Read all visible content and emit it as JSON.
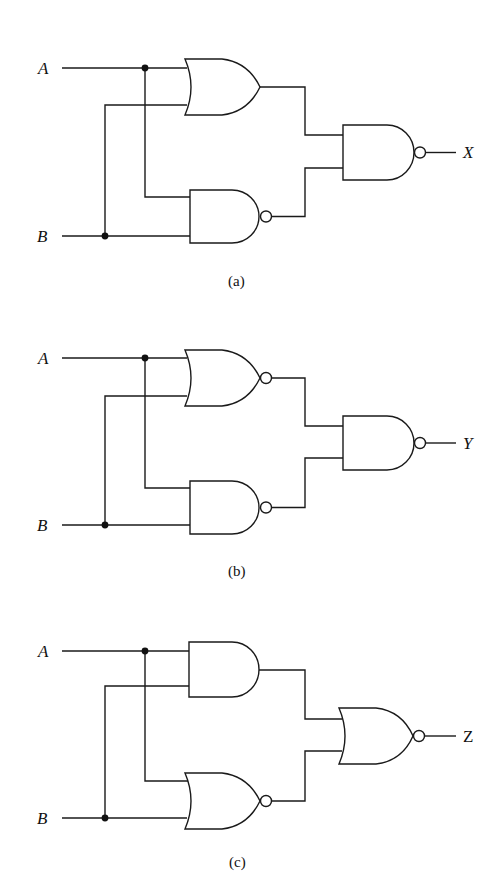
{
  "figure": {
    "panels": [
      {
        "id": "a",
        "caption": "(a)",
        "inputs": [
          "A",
          "B"
        ],
        "output": "X",
        "gates": [
          {
            "name": "upper",
            "type": "OR",
            "inputs": [
              "A",
              "B"
            ]
          },
          {
            "name": "lower",
            "type": "NAND",
            "inputs": [
              "A",
              "B"
            ]
          },
          {
            "name": "output",
            "type": "NAND",
            "inputs": [
              "upper",
              "lower"
            ]
          }
        ]
      },
      {
        "id": "b",
        "caption": "(b)",
        "inputs": [
          "A",
          "B"
        ],
        "output": "Y",
        "gates": [
          {
            "name": "upper",
            "type": "NOR",
            "inputs": [
              "A",
              "B"
            ]
          },
          {
            "name": "lower",
            "type": "NAND",
            "inputs": [
              "A",
              "B"
            ]
          },
          {
            "name": "output",
            "type": "NAND",
            "inputs": [
              "upper",
              "lower"
            ]
          }
        ]
      },
      {
        "id": "c",
        "caption": "(c)",
        "inputs": [
          "A",
          "B"
        ],
        "output": "Z",
        "gates": [
          {
            "name": "upper",
            "type": "AND",
            "inputs": [
              "A",
              "B"
            ]
          },
          {
            "name": "lower",
            "type": "NOR",
            "inputs": [
              "A",
              "B"
            ]
          },
          {
            "name": "output",
            "type": "NOR",
            "inputs": [
              "upper",
              "lower"
            ]
          }
        ]
      }
    ]
  }
}
